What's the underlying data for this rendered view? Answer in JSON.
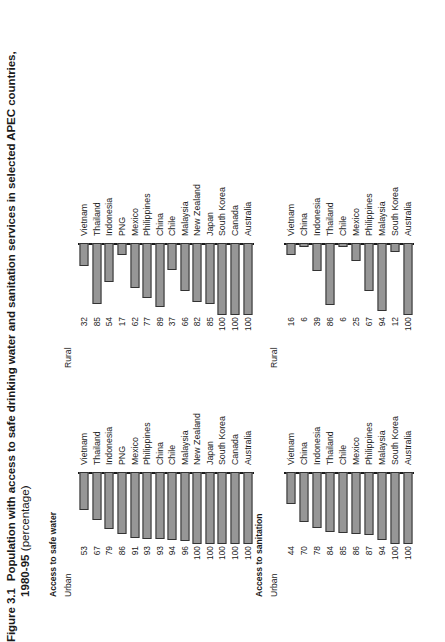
{
  "figure": {
    "label": "Figure 3.1",
    "title": "Population with access to safe drinking water and sanitation services in selected APEC countries,",
    "years": "1980-95",
    "unit": "(percentage)"
  },
  "sections": {
    "sanitation": {
      "heading": "Access to sanitation",
      "urban_label": "Urban",
      "rural_label": "Rural"
    },
    "water": {
      "heading": "Access to safe water",
      "urban_label": "Urban",
      "rural_label": "Rural"
    }
  },
  "chart_data": [
    {
      "type": "bar",
      "title": "Access to sanitation",
      "subtitle": "Urban",
      "orientation": "horizontal",
      "xlabel": "",
      "ylabel": "",
      "xlim": [
        0,
        100
      ],
      "grid": false,
      "legend": "none",
      "categories": [
        "Australia",
        "South Korea",
        "Malaysia",
        "Philippines",
        "Mexico",
        "Chile",
        "Thailand",
        "Indonesia",
        "China",
        "Vietnam"
      ],
      "values": [
        100,
        100,
        94,
        87,
        86,
        85,
        84,
        78,
        70,
        44
      ]
    },
    {
      "type": "bar",
      "title": "Access to sanitation",
      "subtitle": "Rural",
      "orientation": "horizontal",
      "xlabel": "",
      "ylabel": "",
      "xlim": [
        0,
        100
      ],
      "grid": false,
      "legend": "none",
      "categories": [
        "Australia",
        "South Korea",
        "Malaysia",
        "Philippines",
        "Mexico",
        "Chile",
        "Thailand",
        "Indonesia",
        "China",
        "Vietnam"
      ],
      "values": [
        100,
        12,
        94,
        67,
        25,
        6,
        86,
        39,
        6,
        16
      ]
    },
    {
      "type": "bar",
      "title": "Access to safe water",
      "subtitle": "Urban",
      "orientation": "horizontal",
      "xlabel": "",
      "ylabel": "",
      "xlim": [
        0,
        100
      ],
      "grid": false,
      "legend": "none",
      "categories": [
        "Australia",
        "Canada",
        "South Korea",
        "Japan",
        "New Zealand",
        "Malaysia",
        "Chile",
        "China",
        "Philippines",
        "Mexico",
        "PNG",
        "Indonesia",
        "Thailand",
        "Vietnam"
      ],
      "values": [
        100,
        100,
        100,
        100,
        100,
        96,
        94,
        93,
        93,
        91,
        86,
        79,
        67,
        53
      ]
    },
    {
      "type": "bar",
      "title": "Access to safe water",
      "subtitle": "Rural",
      "orientation": "horizontal",
      "xlabel": "",
      "ylabel": "",
      "xlim": [
        0,
        100
      ],
      "grid": false,
      "legend": "none",
      "categories": [
        "Australia",
        "Canada",
        "South Korea",
        "Japan",
        "New Zealand",
        "Malaysia",
        "Chile",
        "China",
        "Philippines",
        "Mexico",
        "PNG",
        "Indonesia",
        "Thailand",
        "Vietnam"
      ],
      "values": [
        100,
        100,
        100,
        85,
        82,
        66,
        37,
        89,
        77,
        62,
        17,
        54,
        85,
        32
      ]
    }
  ],
  "style": {
    "bar_fill": "#969696",
    "bar_stroke": "#333333",
    "axis_color": "#1a1a1a",
    "text_color": "#1a1a1a"
  }
}
